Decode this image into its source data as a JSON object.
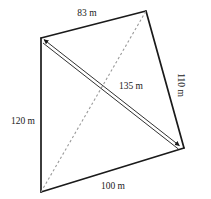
{
  "figure": {
    "background_color": "#ffffff",
    "stroke_color": "#1a1a1a",
    "dashed_color": "#9a9a9a",
    "arrow_color": "#1a1a1a",
    "units": "m"
  },
  "vertices": {
    "top_left": {
      "x": 41,
      "y": 38
    },
    "top_right": {
      "x": 146,
      "y": 11
    },
    "right": {
      "x": 184,
      "y": 148
    },
    "bottom_left": {
      "x": 41,
      "y": 192
    }
  },
  "sides": [
    {
      "name": "top-side",
      "label": "83 m",
      "from": "top_left",
      "to": "top_right",
      "label_x": 87,
      "label_y": 14,
      "rotation": 0
    },
    {
      "name": "right-side",
      "label": "110 m",
      "from": "top_right",
      "to": "right",
      "label_x": 180,
      "label_y": 85,
      "rotation": 90
    },
    {
      "name": "bottom-side",
      "label": "100 m",
      "from": "bottom_left",
      "to": "right",
      "label_x": 113,
      "label_y": 187,
      "rotation": 0
    },
    {
      "name": "left-side",
      "label": "120 m",
      "from": "top_left",
      "to": "bottom_left",
      "label_x": 23,
      "label_y": 122,
      "rotation": 0
    }
  ],
  "diagonals": [
    {
      "name": "dashed-diagonal",
      "style": "dashed",
      "label": "",
      "from": "bottom_left",
      "to": "top_right"
    },
    {
      "name": "measured-diagonal",
      "style": "double-arrow",
      "label": "135 m",
      "from": "top_left",
      "to": "right",
      "label_x": 131,
      "label_y": 87,
      "rotation": 0
    }
  ]
}
